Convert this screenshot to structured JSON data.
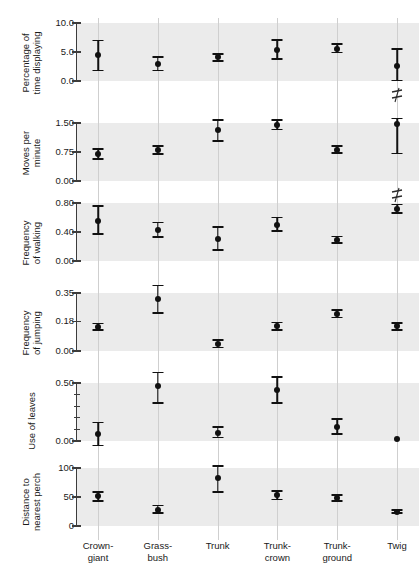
{
  "chart_data": {
    "type": "scatter",
    "title": "",
    "xlabel": "",
    "grid": "vertical gridlines at each category; horizontal shaded band spanning interior of each panel",
    "legend": "none",
    "categories": [
      "Crown-giant",
      "Grass-bush",
      "Trunk",
      "Trunk-crown",
      "Trunk-ground",
      "Twig"
    ],
    "category_labels": [
      {
        "line1": "Crown-",
        "line2": "giant"
      },
      {
        "line1": "Grass-",
        "line2": "bush"
      },
      {
        "line1": "Trunk",
        "line2": ""
      },
      {
        "line1": "Trunk-",
        "line2": "crown"
      },
      {
        "line1": "Trunk-",
        "line2": "ground"
      },
      {
        "line1": "Twig",
        "line2": ""
      }
    ],
    "panels": [
      {
        "id": "percentage-of-time-displaying",
        "ylabel_lines": [
          "Percentage of",
          "time displaying"
        ],
        "ylim": [
          0.0,
          10.0
        ],
        "yticks": [
          0.0,
          5.0,
          10.0
        ],
        "ytick_labels": [
          "0.0",
          "5.0",
          "10.0"
        ],
        "minor_ticks": [],
        "points": [
          {
            "category": "Crown-giant",
            "value": 4.4,
            "low": 1.8,
            "high": 7.0,
            "break": false
          },
          {
            "category": "Grass-bush",
            "value": 3.0,
            "low": 1.8,
            "high": 4.1,
            "break": false
          },
          {
            "category": "Trunk",
            "value": 4.1,
            "low": 3.4,
            "high": 4.7,
            "break": false
          },
          {
            "category": "Trunk-crown",
            "value": 5.3,
            "low": 3.8,
            "high": 7.1,
            "break": false
          },
          {
            "category": "Trunk-ground",
            "value": 5.6,
            "low": 4.9,
            "high": 6.4,
            "break": false
          },
          {
            "category": "Twig",
            "value": 2.6,
            "low": 0.1,
            "high": 5.5,
            "break": true
          }
        ]
      },
      {
        "id": "moves-per-minute",
        "ylabel_lines": [
          "Moves per",
          "minute"
        ],
        "ylim": [
          0.0,
          1.5
        ],
        "yticks": [
          0.0,
          0.75,
          1.5
        ],
        "ytick_labels": [
          "0.00",
          "0.75",
          "1.50"
        ],
        "minor_ticks": [],
        "points": [
          {
            "category": "Crown-giant",
            "value": 0.7,
            "low": 0.57,
            "high": 0.83,
            "break": false
          },
          {
            "category": "Grass-bush",
            "value": 0.8,
            "low": 0.7,
            "high": 0.91,
            "break": false
          },
          {
            "category": "Trunk",
            "value": 1.31,
            "low": 1.03,
            "high": 1.57,
            "break": false
          },
          {
            "category": "Trunk-crown",
            "value": 1.45,
            "low": 1.33,
            "high": 1.57,
            "break": false
          },
          {
            "category": "Trunk-ground",
            "value": 0.81,
            "low": 0.72,
            "high": 0.9,
            "break": false
          },
          {
            "category": "Twig",
            "value": 1.47,
            "low": 0.71,
            "high": 1.62,
            "break": true
          }
        ]
      },
      {
        "id": "frequency-of-walking",
        "ylabel_lines": [
          "Frequency",
          "of walking"
        ],
        "ylim": [
          0.0,
          0.8
        ],
        "yticks": [
          0.0,
          0.4,
          0.8
        ],
        "ytick_labels": [
          "0.00",
          "0.40",
          "0.80"
        ],
        "minor_ticks": [],
        "points": [
          {
            "category": "Crown-giant",
            "value": 0.55,
            "low": 0.37,
            "high": 0.76,
            "break": false
          },
          {
            "category": "Grass-bush",
            "value": 0.43,
            "low": 0.33,
            "high": 0.53,
            "break": false
          },
          {
            "category": "Trunk",
            "value": 0.3,
            "low": 0.15,
            "high": 0.47,
            "break": false
          },
          {
            "category": "Trunk-crown",
            "value": 0.5,
            "low": 0.41,
            "high": 0.6,
            "break": false
          },
          {
            "category": "Trunk-ground",
            "value": 0.29,
            "low": 0.25,
            "high": 0.34,
            "break": false
          },
          {
            "category": "Twig",
            "value": 0.72,
            "low": 0.66,
            "high": 0.78,
            "break": false
          }
        ]
      },
      {
        "id": "frequency-of-jumping",
        "ylabel_lines": [
          "Frequency",
          "of jumping"
        ],
        "ylim": [
          0.0,
          0.35
        ],
        "yticks": [
          0.0,
          0.18,
          0.35
        ],
        "ytick_labels": [
          "0.00",
          "0.18",
          "0.35"
        ],
        "minor_ticks": [],
        "points": [
          {
            "category": "Crown-giant",
            "value": 0.147,
            "low": 0.128,
            "high": 0.165,
            "break": false
          },
          {
            "category": "Grass-bush",
            "value": 0.313,
            "low": 0.228,
            "high": 0.395,
            "break": false
          },
          {
            "category": "Trunk",
            "value": 0.043,
            "low": 0.02,
            "high": 0.068,
            "break": false
          },
          {
            "category": "Trunk-crown",
            "value": 0.15,
            "low": 0.126,
            "high": 0.173,
            "break": false
          },
          {
            "category": "Trunk-ground",
            "value": 0.226,
            "low": 0.203,
            "high": 0.249,
            "break": false
          },
          {
            "category": "Twig",
            "value": 0.148,
            "low": 0.128,
            "high": 0.169,
            "break": false
          }
        ]
      },
      {
        "id": "use-of-leaves",
        "ylabel_lines": [
          "Use of leaves"
        ],
        "ylim": [
          0.0,
          0.5
        ],
        "yticks": [
          0.0,
          0.5
        ],
        "ytick_labels": [
          "0.00",
          "0.50"
        ],
        "minor_ticks": [
          0.1,
          0.2,
          0.3,
          0.4
        ],
        "points": [
          {
            "category": "Crown-giant",
            "value": 0.06,
            "low": -0.04,
            "high": 0.16,
            "break": false
          },
          {
            "category": "Grass-bush",
            "value": 0.47,
            "low": 0.33,
            "high": 0.59,
            "break": false
          },
          {
            "category": "Trunk",
            "value": 0.07,
            "low": 0.03,
            "high": 0.12,
            "break": false
          },
          {
            "category": "Trunk-crown",
            "value": 0.44,
            "low": 0.33,
            "high": 0.55,
            "break": false
          },
          {
            "category": "Trunk-ground",
            "value": 0.12,
            "low": 0.06,
            "high": 0.19,
            "break": false
          },
          {
            "category": "Twig",
            "value": 0.02,
            "low": null,
            "high": null,
            "break": false
          }
        ]
      },
      {
        "id": "distance-to-nearest-perch",
        "ylabel_lines": [
          "Distance to",
          "nearest perch"
        ],
        "ylim": [
          0,
          100
        ],
        "yticks": [
          0,
          50,
          100
        ],
        "ytick_labels": [
          "0",
          "50",
          "100"
        ],
        "minor_ticks": [],
        "points": [
          {
            "category": "Crown-giant",
            "value": 51,
            "low": 43,
            "high": 59,
            "break": false
          },
          {
            "category": "Grass-bush",
            "value": 28,
            "low": 22,
            "high": 35,
            "break": false
          },
          {
            "category": "Trunk",
            "value": 82,
            "low": 59,
            "high": 103,
            "break": false
          },
          {
            "category": "Trunk-crown",
            "value": 53,
            "low": 46,
            "high": 60,
            "break": false
          },
          {
            "category": "Trunk-ground",
            "value": 48,
            "low": 43,
            "high": 53,
            "break": false
          },
          {
            "category": "Twig",
            "value": 25,
            "low": 22,
            "high": 28,
            "break": false
          }
        ]
      }
    ],
    "colors": {
      "band": "#ebebeb",
      "gridline": "#cfcfcf",
      "marker": "#111111",
      "axis": "#3c3c3c",
      "text": "#1a1a1a",
      "background": "#ffffff"
    }
  }
}
